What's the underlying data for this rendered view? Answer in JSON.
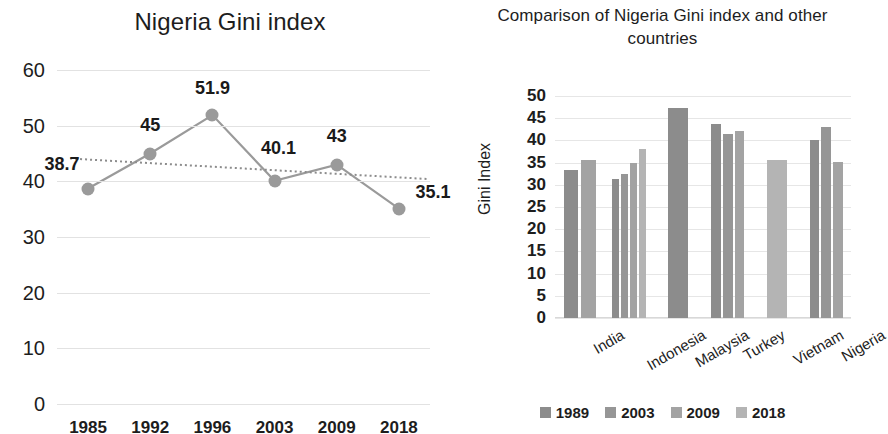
{
  "chart_data": [
    {
      "type": "line",
      "title": "Nigeria Gini index",
      "xlabel": "",
      "ylabel": "",
      "categories": [
        "1985",
        "1992",
        "1996",
        "2003",
        "2009",
        "2018"
      ],
      "values": [
        38.7,
        45,
        51.9,
        40.1,
        43,
        35.1
      ],
      "data_labels": [
        "38.7",
        "45",
        "51.9",
        "40.1",
        "43",
        "35.1"
      ],
      "ylim": [
        0,
        60
      ],
      "yticks": [
        "0",
        "10",
        "20",
        "30",
        "40",
        "50",
        "60"
      ],
      "grid": true,
      "legend": "none",
      "series_color": "#9a9a9a",
      "trendline": {
        "style": "dotted",
        "color": "#8c8c8c",
        "start_value": 44.1,
        "end_value": 40.4
      }
    },
    {
      "type": "bar",
      "title": "Comparison of Nigeria Gini index and other countries",
      "xlabel": "",
      "ylabel": "Gini Index",
      "categories": [
        "India",
        "Indonesia",
        "Malaysia",
        "Turkey",
        "Vietnam",
        "Nigeria"
      ],
      "ylim": [
        0,
        50
      ],
      "yticks": [
        "0",
        "5",
        "10",
        "15",
        "20",
        "25",
        "30",
        "35",
        "40",
        "45",
        "50"
      ],
      "grid": true,
      "legend": "bottom",
      "series": [
        {
          "name": "1989",
          "color": "#8c8c8c",
          "values": [
            33.4,
            31.3,
            47.3,
            43.6,
            null,
            40.1
          ]
        },
        {
          "name": "2003",
          "color": "#969696",
          "values": [
            null,
            32.4,
            null,
            41.5,
            null,
            43.0
          ]
        },
        {
          "name": "2009",
          "color": "#a3a3a3",
          "values": [
            35.7,
            35.0,
            null,
            42.2,
            null,
            35.1
          ]
        },
        {
          "name": "2018",
          "color": "#b4b4b4",
          "values": [
            null,
            38.1,
            null,
            null,
            35.7,
            null
          ]
        }
      ]
    }
  ]
}
